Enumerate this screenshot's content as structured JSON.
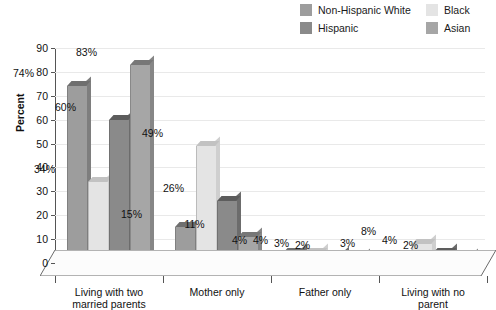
{
  "chart_data": {
    "type": "bar",
    "title": "",
    "subtitle": "",
    "xlabel": "",
    "ylabel": "Percent",
    "ylim": [
      0,
      90
    ],
    "ytick_step": 10,
    "yticks": [
      "90",
      "80",
      "70",
      "60",
      "50",
      "40",
      "30",
      "20",
      "10",
      "0"
    ],
    "grid": true,
    "legend_position": "top-right",
    "value_suffix": "%",
    "categories": [
      "Living with two married parents",
      "Mother only",
      "Father only",
      "Living with no parent"
    ],
    "category_lines": [
      [
        "Living with two",
        "married parents"
      ],
      [
        "Mother only",
        ""
      ],
      [
        "Father only",
        ""
      ],
      [
        "Living with no",
        "parent"
      ]
    ],
    "series": [
      {
        "name": "Non-Hispanic White",
        "color": "#9d9d9d",
        "cap_color": "#6f6f6f",
        "side_color": "#7e7e7e",
        "values": [
          74,
          15,
          4,
          3
        ],
        "labels": [
          "74%",
          "15%",
          "4%",
          "3%"
        ]
      },
      {
        "name": "Black",
        "color": "#e4e4e4",
        "cap_color": "#c2c2c2",
        "side_color": "#cfcfcf",
        "values": [
          34,
          49,
          4,
          8
        ],
        "labels": [
          "34%",
          "49%",
          "4%",
          "8%"
        ]
      },
      {
        "name": "Hispanic",
        "color": "#8a8a8a",
        "cap_color": "#5d5d5d",
        "side_color": "#6c6c6c",
        "values": [
          60,
          26,
          3,
          4
        ],
        "labels": [
          "60%",
          "26%",
          "3%",
          "4%"
        ]
      },
      {
        "name": "Asian",
        "color": "#a6a6a6",
        "cap_color": "#777777",
        "side_color": "#868686",
        "values": [
          83,
          11,
          2,
          2
        ],
        "labels": [
          "83%",
          "11%",
          "2%",
          "2%"
        ]
      }
    ]
  },
  "legend": {
    "entries": [
      {
        "label": "Non-Hispanic White",
        "color": "#9d9d9d"
      },
      {
        "label": "Hispanic",
        "color": "#8a8a8a"
      },
      {
        "label": "Black",
        "color": "#e4e4e4"
      },
      {
        "label": "Asian",
        "color": "#a6a6a6"
      }
    ]
  },
  "axis": {
    "y_title": "Percent"
  }
}
